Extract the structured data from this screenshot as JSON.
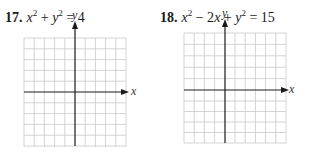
{
  "problems": [
    {
      "number": "17.",
      "equation": {
        "parts": [
          "x",
          "2",
          " + ",
          "y",
          "2",
          " = 4"
        ]
      },
      "equation_text": "x² + y² = 4",
      "graph": {
        "x_axis_label": "x",
        "y_axis_label": "y",
        "columns": 10,
        "rows": 10,
        "y_axis_column": 5,
        "x_axis_row": 5
      }
    },
    {
      "number": "18.",
      "equation_text": "x² − 2x + y² = 15",
      "graph": {
        "x_axis_label": "x",
        "y_axis_label": "y",
        "columns": 10,
        "rows": 10,
        "y_axis_column": 4,
        "x_axis_row": 5
      }
    }
  ],
  "colors": {
    "grid": "#c8c8c8",
    "axis": "#1a1a1a",
    "text": "#1a1a1a"
  }
}
